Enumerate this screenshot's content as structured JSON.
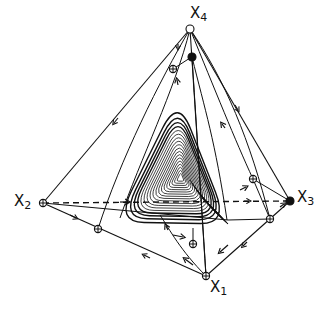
{
  "figure": {
    "type": "phase-portrait-simplex",
    "colors": {
      "ink": "#111111",
      "background": "#ffffff"
    }
  },
  "vertices": [
    {
      "id": "x1",
      "base": "X",
      "sub": "1",
      "x": 206,
      "y": 276,
      "marker": "saddle",
      "label_x": 210,
      "label_y": 280
    },
    {
      "id": "x2",
      "base": "X",
      "sub": "2",
      "x": 43,
      "y": 203,
      "marker": "saddle",
      "label_x": 14,
      "label_y": 194
    },
    {
      "id": "x3",
      "base": "X",
      "sub": "3",
      "x": 290,
      "y": 201,
      "marker": "sink",
      "label_x": 297,
      "label_y": 190
    },
    {
      "id": "x4",
      "base": "X",
      "sub": "4",
      "x": 190,
      "y": 29,
      "marker": "source",
      "label_x": 190,
      "label_y": 6
    }
  ],
  "fixed_points": [
    {
      "name": "edge-point-x4-x1",
      "x": 192,
      "y": 57,
      "marker": "sink"
    },
    {
      "name": "face-point-upper-left",
      "x": 173,
      "y": 69,
      "marker": "saddle"
    },
    {
      "name": "edge-point-x2-x1",
      "x": 98,
      "y": 229,
      "marker": "saddle"
    },
    {
      "name": "edge-point-x3-x1",
      "x": 270,
      "y": 219,
      "marker": "saddle"
    },
    {
      "name": "face-point-right",
      "x": 253,
      "y": 179,
      "marker": "saddle"
    },
    {
      "name": "interior-point-lower",
      "x": 193,
      "y": 244,
      "marker": "saddle"
    }
  ],
  "legend": {
    "source": "open circle",
    "sink": "filled circle",
    "saddle": "crossed circle"
  }
}
